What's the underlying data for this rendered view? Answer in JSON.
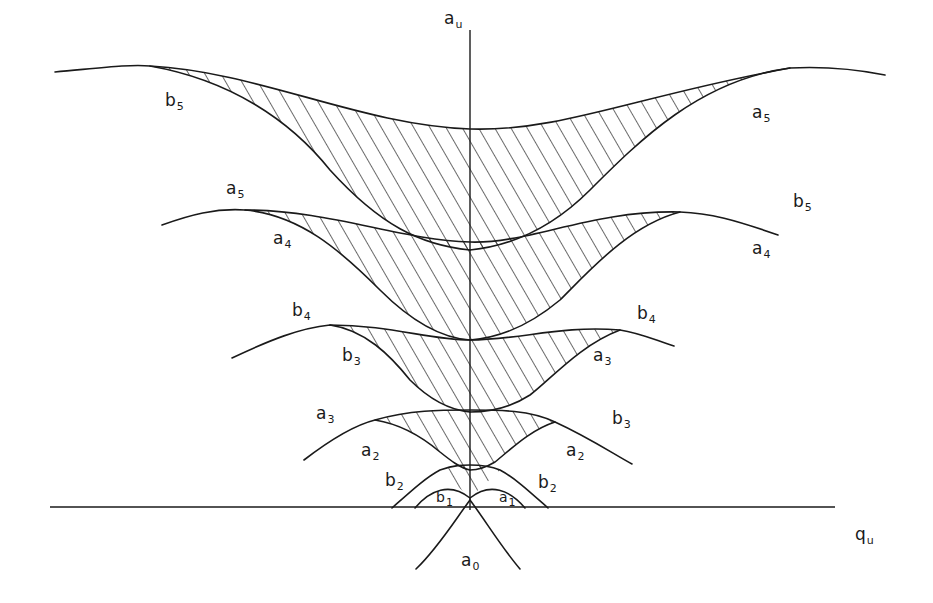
{
  "figure": {
    "type": "stability-diagram",
    "colors": {
      "ink": "#1a1a1a",
      "background": "#ffffff"
    }
  },
  "axes": {
    "vertical": {
      "base": "a",
      "sub": "u"
    },
    "horizontal": {
      "base": "q",
      "sub": "u"
    }
  },
  "labels": [
    {
      "id": "b5-left",
      "base": "b",
      "sub": "5",
      "x": 165,
      "y": 92
    },
    {
      "id": "a5-right-top",
      "base": "a",
      "sub": "5",
      "x": 752,
      "y": 104
    },
    {
      "id": "a5-left",
      "base": "a",
      "sub": "5",
      "x": 226,
      "y": 180
    },
    {
      "id": "b5-right",
      "base": "b",
      "sub": "5",
      "x": 793,
      "y": 193
    },
    {
      "id": "a4-left",
      "base": "a",
      "sub": "4",
      "x": 273,
      "y": 230
    },
    {
      "id": "a4-right",
      "base": "a",
      "sub": "4",
      "x": 752,
      "y": 240
    },
    {
      "id": "b4-left",
      "base": "b",
      "sub": "4",
      "x": 292,
      "y": 302
    },
    {
      "id": "b4-right",
      "base": "b",
      "sub": "4",
      "x": 637,
      "y": 305
    },
    {
      "id": "b3-left",
      "base": "b",
      "sub": "3",
      "x": 342,
      "y": 347
    },
    {
      "id": "a3-right",
      "base": "a",
      "sub": "3",
      "x": 593,
      "y": 347
    },
    {
      "id": "a3-left",
      "base": "a",
      "sub": "3",
      "x": 316,
      "y": 405
    },
    {
      "id": "b3-right",
      "base": "b",
      "sub": "3",
      "x": 612,
      "y": 410
    },
    {
      "id": "a2-left",
      "base": "a",
      "sub": "2",
      "x": 361,
      "y": 442
    },
    {
      "id": "a2-right",
      "base": "a",
      "sub": "2",
      "x": 566,
      "y": 442
    },
    {
      "id": "b2-left",
      "base": "b",
      "sub": "2",
      "x": 385,
      "y": 472
    },
    {
      "id": "b2-right",
      "base": "b",
      "sub": "2",
      "x": 538,
      "y": 474
    },
    {
      "id": "b1",
      "base": "b",
      "sub": "1",
      "x": 436,
      "y": 490
    },
    {
      "id": "a1",
      "base": "a",
      "sub": "1",
      "x": 499,
      "y": 490
    },
    {
      "id": "a0",
      "base": "a",
      "sub": "0",
      "x": 461,
      "y": 552
    }
  ]
}
